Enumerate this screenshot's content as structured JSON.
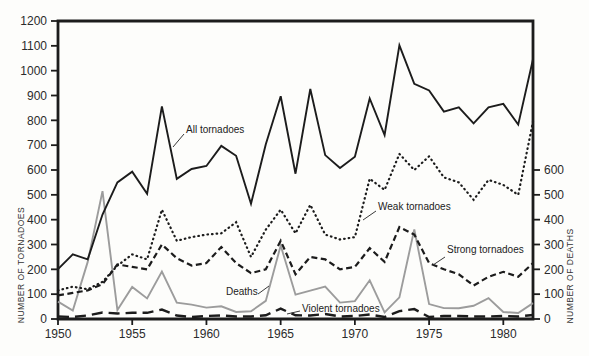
{
  "figure": {
    "background": "#fdfdfb",
    "ink_color": "#1c1c1c",
    "deaths_color": "#9c9c9c",
    "tick_text_color": "#2b2b2b"
  },
  "left_axis": {
    "title": "NUMBER OF TORNADOES",
    "min": 0,
    "max": 1200,
    "step": 100,
    "tick_labels": [
      "0",
      "100",
      "200",
      "300",
      "400",
      "500",
      "600",
      "700",
      "800",
      "900",
      "1000",
      "1100",
      "1200"
    ]
  },
  "right_axis": {
    "title": "NUMBER OF DEATHS",
    "min": 0,
    "max": 600,
    "step": 100,
    "tick_labels": [
      "0",
      "100",
      "200",
      "300",
      "400",
      "500",
      "600"
    ]
  },
  "x_axis": {
    "tick_labels": [
      "1950",
      "1955",
      "1960",
      "1965",
      "1970",
      "1975",
      "1980"
    ],
    "tick_years": [
      1950,
      1955,
      1960,
      1965,
      1970,
      1975,
      1980
    ]
  },
  "annotations": {
    "all": "All tornadoes",
    "weak": "Weak tornadoes",
    "strong": "Strong tornadoes",
    "violent": "Violent tornadoes",
    "deaths": "Deaths"
  },
  "chart_data": {
    "type": "line",
    "title": "",
    "xlabel": "",
    "ylabel_left": "NUMBER OF TORNADOES",
    "ylabel_right": "NUMBER OF DEATHS",
    "xlim": [
      1950,
      1982
    ],
    "ylim_left": [
      0,
      1200
    ],
    "ylim_right": [
      0,
      600
    ],
    "right_axis_same_pixel_scale": true,
    "grid": false,
    "legend_position": "inline-labels",
    "x": [
      1950,
      1951,
      1952,
      1953,
      1954,
      1955,
      1956,
      1957,
      1958,
      1959,
      1960,
      1961,
      1962,
      1963,
      1964,
      1965,
      1966,
      1967,
      1968,
      1969,
      1970,
      1971,
      1972,
      1973,
      1974,
      1975,
      1976,
      1977,
      1978,
      1979,
      1980,
      1981,
      1982
    ],
    "series": [
      {
        "name": "All tornadoes",
        "axis": "left",
        "style": "solid",
        "color": "#1c1c1c",
        "values": [
          201,
          260,
          240,
          421,
          550,
          593,
          504,
          856,
          564,
          604,
          616,
          697,
          657,
          464,
          704,
          897,
          585,
          926,
          660,
          608,
          653,
          888,
          741,
          1102,
          947,
          920,
          835,
          852,
          788,
          852,
          866,
          783,
          1046
        ]
      },
      {
        "name": "Weak tornadoes",
        "axis": "left",
        "style": "dotted",
        "color": "#1c1c1c",
        "values": [
          115,
          130,
          120,
          150,
          215,
          260,
          240,
          440,
          315,
          330,
          340,
          345,
          390,
          250,
          360,
          440,
          345,
          460,
          340,
          320,
          330,
          565,
          520,
          665,
          600,
          655,
          570,
          550,
          480,
          560,
          540,
          500,
          795
        ]
      },
      {
        "name": "Strong tornadoes",
        "axis": "left",
        "style": "dashed",
        "color": "#1c1c1c",
        "values": [
          95,
          105,
          115,
          140,
          220,
          210,
          200,
          300,
          245,
          215,
          225,
          290,
          225,
          185,
          200,
          315,
          180,
          250,
          240,
          200,
          210,
          285,
          230,
          370,
          340,
          225,
          200,
          180,
          135,
          170,
          190,
          170,
          225
        ]
      },
      {
        "name": "Violent tornadoes",
        "axis": "left",
        "style": "long-dash",
        "color": "#1c1c1c",
        "values": [
          10,
          8,
          14,
          26,
          22,
          25,
          25,
          38,
          14,
          8,
          12,
          14,
          10,
          10,
          15,
          42,
          15,
          14,
          20,
          10,
          12,
          18,
          8,
          32,
          40,
          8,
          12,
          12,
          10,
          10,
          12,
          10,
          16
        ]
      },
      {
        "name": "Deaths",
        "axis": "right",
        "style": "solid",
        "color": "#9c9c9c",
        "values": [
          70,
          34,
          230,
          515,
          36,
          129,
          83,
          191,
          66,
          58,
          46,
          51,
          28,
          31,
          73,
          296,
          98,
          114,
          131,
          66,
          72,
          156,
          27,
          87,
          361,
          60,
          44,
          43,
          53,
          84,
          28,
          24,
          64
        ]
      }
    ]
  }
}
